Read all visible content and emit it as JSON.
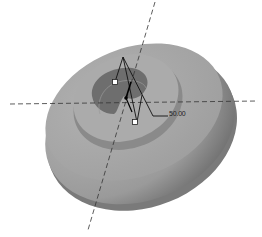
{
  "viewport": {
    "background": "#ffffff",
    "model": {
      "name": "disc-with-spiral-groove",
      "body_color": "#a9a9a9",
      "side_color": "#8c8c8c",
      "groove_color": "#6e6e6e"
    },
    "axes": {
      "horizontal": "dashed centerline",
      "inclined": "dashed centerline"
    },
    "dimension": {
      "value": "50.00"
    },
    "handles": [
      {
        "name": "drag-handle-upper"
      },
      {
        "name": "drag-handle-lower"
      }
    ]
  }
}
